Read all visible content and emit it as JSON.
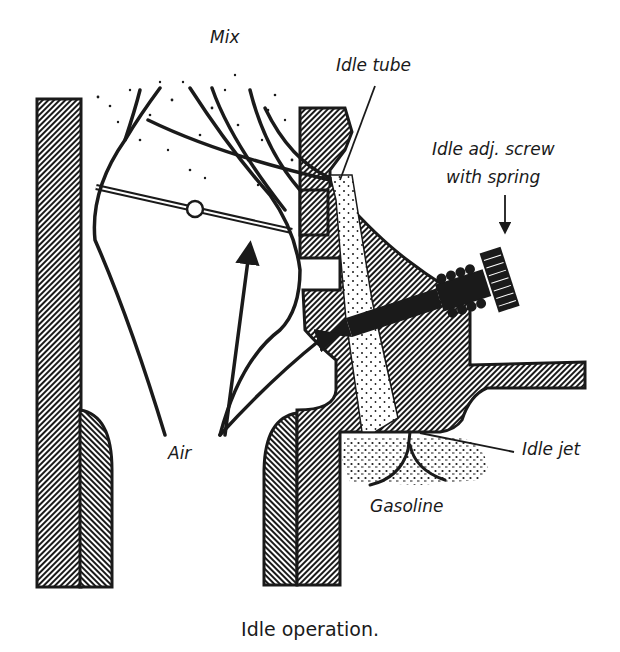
{
  "figure": {
    "caption": "Idle operation.",
    "labels": {
      "mix": "Mix",
      "idle_tube": "Idle tube",
      "idle_adj_screw_line1": "Idle adj. screw",
      "idle_adj_screw_line2": "with spring",
      "air": "Air",
      "idle_jet": "Idle jet",
      "gasoline": "Gasoline"
    },
    "colors": {
      "ink": "#1a1a1a",
      "background": "#ffffff"
    }
  }
}
